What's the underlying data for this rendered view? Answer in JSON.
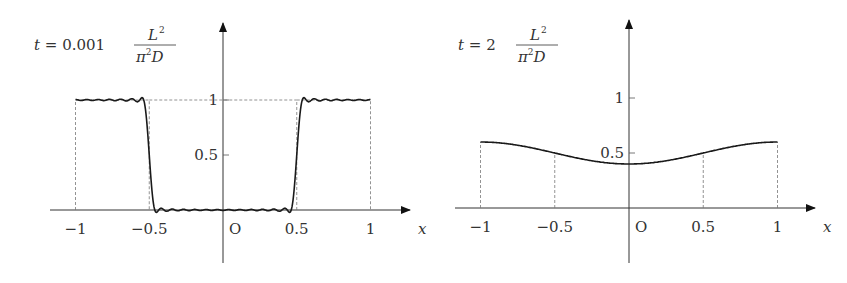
{
  "chart_data": [
    {
      "type": "line",
      "title": "t = 0.001 L^2/(pi^2 D)",
      "title_parts": {
        "lhs": "t",
        "eq": "=",
        "coef": "0.001",
        "num": "L",
        "num_sup": "2",
        "den_pi": "π",
        "den_sup": "2",
        "den_D": "D"
      },
      "xlabel": "x",
      "ylabel": "",
      "origin_label": "O",
      "x_ticks": [
        -1,
        -0.5,
        0.5,
        1
      ],
      "x_tick_labels": [
        "−1",
        "−0.5",
        "0.5",
        "1"
      ],
      "y_ticks": [
        0.5,
        1
      ],
      "y_tick_labels": [
        "0.5",
        "1"
      ],
      "xlim": [
        -1.1,
        1.1
      ],
      "ylim": [
        -0.3,
        1.55
      ],
      "grid": false,
      "reference_square_wave": {
        "x_low": [
          -0.5,
          0.5
        ],
        "y_high": 1,
        "dashed": true
      },
      "series": [
        {
          "name": "u(x,t) Fourier approximation (oscillating)",
          "style": "gibbs",
          "x": [
            -1,
            -0.9,
            -0.8,
            -0.7,
            -0.6,
            -0.55,
            -0.52,
            -0.5,
            -0.48,
            -0.45,
            -0.4,
            -0.3,
            -0.2,
            -0.1,
            0,
            0.1,
            0.2,
            0.3,
            0.4,
            0.45,
            0.48,
            0.5,
            0.52,
            0.55,
            0.6,
            0.7,
            0.8,
            0.9,
            1
          ],
          "y": [
            0.95,
            0.96,
            0.95,
            0.96,
            0.95,
            1.0,
            0.9,
            0.5,
            0.1,
            0.0,
            0.03,
            0.02,
            0.03,
            0.02,
            0.03,
            0.02,
            0.03,
            0.02,
            0.03,
            0.0,
            0.1,
            0.5,
            0.9,
            1.0,
            0.95,
            0.96,
            0.95,
            0.96,
            0.95
          ]
        }
      ]
    },
    {
      "type": "line",
      "title": "t = 2 L^2/(pi^2 D)",
      "title_parts": {
        "lhs": "t",
        "eq": "=",
        "coef": "2",
        "num": "L",
        "num_sup": "2",
        "den_pi": "π",
        "den_sup": "2",
        "den_D": "D"
      },
      "xlabel": "x",
      "ylabel": "",
      "origin_label": "O",
      "x_ticks": [
        -1,
        -0.5,
        0.5,
        1
      ],
      "x_tick_labels": [
        "−1",
        "−0.5",
        "0.5",
        "1"
      ],
      "y_ticks": [
        0.5,
        1
      ],
      "y_tick_labels": [
        "0.5",
        "1"
      ],
      "xlim": [
        -1.1,
        1.1
      ],
      "ylim": [
        -0.3,
        1.55
      ],
      "grid": false,
      "series": [
        {
          "name": "u(x,t) smoothed",
          "x": [
            -1,
            -0.75,
            -0.5,
            -0.25,
            0,
            0.25,
            0.5,
            0.75,
            1
          ],
          "y": [
            0.6,
            0.57,
            0.5,
            0.43,
            0.4,
            0.43,
            0.5,
            0.57,
            0.6
          ]
        }
      ]
    }
  ]
}
